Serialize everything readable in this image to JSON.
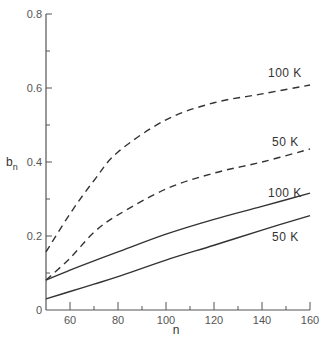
{
  "chart_data": {
    "type": "line",
    "title": "",
    "xlabel": "n",
    "ylabel": "b_n",
    "xlim": [
      50,
      160
    ],
    "ylim": [
      0,
      0.8
    ],
    "grid": false,
    "x_ticks": [
      60,
      80,
      100,
      120,
      140,
      160
    ],
    "x_minor_ticks": [
      70,
      90,
      110,
      130,
      150
    ],
    "y_ticks": [
      0,
      0.2,
      0.4,
      0.6,
      0.8
    ],
    "y_tick_labels": [
      "0",
      "0.2",
      "0.4",
      "0.6",
      "0.8"
    ],
    "y_minor_ticks": [
      0.1,
      0.3,
      0.5,
      0.7
    ],
    "x": [
      50,
      60,
      70,
      80,
      100,
      120,
      140,
      160
    ],
    "series": [
      {
        "name": "100 K (dashed)",
        "style": "dashed",
        "label": "100 K",
        "values": [
          0.157,
          0.26,
          0.35,
          0.427,
          0.514,
          0.56,
          0.584,
          0.608
        ]
      },
      {
        "name": "50 K (dashed)",
        "style": "dashed",
        "label": "50 K",
        "values": [
          0.081,
          0.14,
          0.21,
          0.257,
          0.327,
          0.37,
          0.4,
          0.435
        ]
      },
      {
        "name": "100 K (solid)",
        "style": "solid",
        "label": "100 K",
        "values": [
          0.081,
          0.108,
          0.133,
          0.157,
          0.205,
          0.245,
          0.28,
          0.316
        ]
      },
      {
        "name": "50 K (solid)",
        "style": "solid",
        "label": "50 K",
        "values": [
          0.03,
          0.05,
          0.07,
          0.09,
          0.135,
          0.175,
          0.216,
          0.255
        ]
      }
    ],
    "annotations": [
      "100 K",
      "50 K",
      "100 K",
      "50 K"
    ]
  },
  "colors": {
    "line": "#333333",
    "axis": "#555555",
    "background": "#ffffff"
  }
}
